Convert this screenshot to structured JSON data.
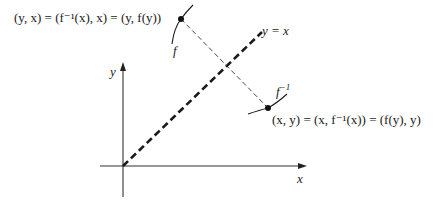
{
  "diagram": {
    "labels": {
      "top_point": "(y, x) = (f⁻¹(x), x) = (y, f(y))",
      "bottom_point": "(x, y) = (x, f⁻¹(x)) = (f(y), y)",
      "diagonal": "y = x",
      "f_curve": "f",
      "f_inv_curve_base": "f",
      "f_inv_curve_sup": "−1",
      "x_axis": "x",
      "y_axis": "y"
    },
    "points": {
      "top": {
        "x": 181,
        "y": 19
      },
      "bottom": {
        "x": 268,
        "y": 108
      },
      "origin": {
        "x": 123,
        "y": 166
      }
    },
    "colors": {
      "ink": "#1a1a1a",
      "axis": "#333333",
      "background": "#ffffff"
    }
  }
}
